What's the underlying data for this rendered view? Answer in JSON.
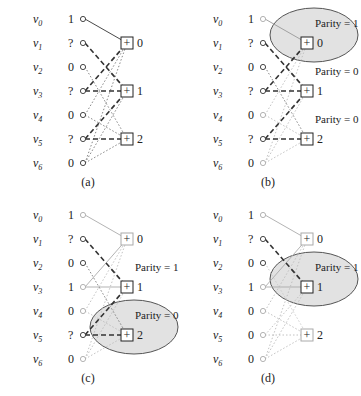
{
  "figure": {
    "variable_labels": [
      "v0",
      "v1",
      "v2",
      "v3",
      "v4",
      "v5",
      "v6"
    ],
    "check_labels": [
      "0",
      "1",
      "2"
    ],
    "check_symbol": "+",
    "edges": [
      {
        "check": 0,
        "var": 0
      },
      {
        "check": 0,
        "var": 3
      },
      {
        "check": 0,
        "var": 4
      },
      {
        "check": 0,
        "var": 6
      },
      {
        "check": 1,
        "var": 1
      },
      {
        "check": 1,
        "var": 3
      },
      {
        "check": 1,
        "var": 5
      },
      {
        "check": 1,
        "var": 6
      },
      {
        "check": 2,
        "var": 2
      },
      {
        "check": 2,
        "var": 4
      },
      {
        "check": 2,
        "var": 5
      },
      {
        "check": 2,
        "var": 6
      }
    ],
    "panels": [
      {
        "caption": "(a)",
        "values": [
          "1",
          "?",
          "0",
          "?",
          "0",
          "?",
          "0"
        ],
        "parity_labels": [],
        "highlight_check": null
      },
      {
        "caption": "(b)",
        "values": [
          "1",
          "?",
          "0",
          "?",
          "0",
          "?",
          "0"
        ],
        "parity_labels": [
          {
            "check": 0,
            "text": "Parity = 1"
          },
          {
            "check": 1,
            "text": "Parity = 0"
          },
          {
            "check": 2,
            "text": "Parity = 0"
          }
        ],
        "highlight_check": 0
      },
      {
        "caption": "(c)",
        "values": [
          "1",
          "?",
          "0",
          "1",
          "0",
          "?",
          "0"
        ],
        "parity_labels": [
          {
            "check": 1,
            "text": "Parity = 1"
          },
          {
            "check": 2,
            "text": "Parity = 0"
          }
        ],
        "highlight_check": 2
      },
      {
        "caption": "(d)",
        "values": [
          "1",
          "?",
          "0",
          "1",
          "0",
          "0",
          "0"
        ],
        "parity_labels": [
          {
            "check": 1,
            "text": "Parity = 1"
          }
        ],
        "highlight_check": 1
      }
    ]
  },
  "colors": {
    "line": "#333333",
    "faded": "#b0b0b0",
    "ellipse_fill": "#e2e2e2",
    "ellipse_stroke": "#555555"
  }
}
